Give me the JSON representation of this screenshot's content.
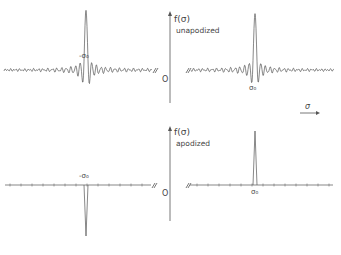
{
  "figure": {
    "top_panel": {
      "y_axis_label": "f(σ)",
      "caption": "unapodized",
      "origin_label": "O",
      "neg_peak_label": "-σ₀",
      "pos_peak_label": "σ₀"
    },
    "bottom_panel": {
      "y_axis_label": "f(σ)",
      "caption": "apodized",
      "origin_label": "O",
      "neg_peak_label": "-σ₀",
      "pos_peak_label": "σ₀"
    },
    "x_axis_label": "σ",
    "line_color": "#555555"
  }
}
